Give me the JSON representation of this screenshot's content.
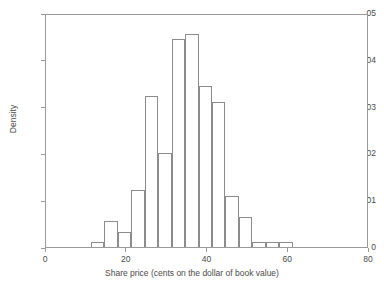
{
  "chart_data": {
    "type": "bar",
    "title": "",
    "subtitle": "",
    "xlabel": "Share price (cents on the dollar of book value)",
    "ylabel": "Density",
    "xlim": [
      0,
      80
    ],
    "ylim": [
      0,
      0.05
    ],
    "xticks": [
      0,
      20,
      40,
      60,
      80
    ],
    "xtick_labels": [
      "0",
      "20",
      "40",
      "60",
      "80"
    ],
    "yticks": [
      0,
      0.01,
      0.02,
      0.03,
      0.04,
      0.05
    ],
    "ytick_labels": [
      "0",
      ".01",
      ".02",
      ".03",
      ".04",
      ".05"
    ],
    "grid": false,
    "legend": null,
    "bin_width": 3.33,
    "bin_starts": [
      11.1,
      14.4,
      17.8,
      21.1,
      24.4,
      27.8,
      31.1,
      34.4,
      37.8,
      41.1,
      44.4,
      47.8,
      51.1,
      54.4,
      57.8,
      61.1,
      64.4,
      67.8
    ],
    "categories": [
      "11.1-14.4",
      "14.4-17.8",
      "17.8-21.1",
      "21.1-24.4",
      "24.4-27.8",
      "27.8-31.1",
      "31.1-34.4",
      "34.4-37.8",
      "37.8-41.1",
      "41.1-44.4",
      "44.4-47.8",
      "47.8-51.1",
      "51.1-54.4",
      "54.4-57.8",
      "57.8-61.1",
      "61.1-64.4",
      "64.4-67.8",
      "67.8-71.1"
    ],
    "values": [
      0.0011,
      0.0055,
      0.0033,
      0.0122,
      0.0322,
      0.02,
      0.0445,
      0.0456,
      0.0344,
      0.031,
      0.0108,
      0.0064,
      0.0011,
      0.0011,
      0.0011,
      0,
      0,
      0
    ],
    "bars": [
      {
        "x0": 11.1,
        "x1": 14.4,
        "density": 0.0011
      },
      {
        "x0": 14.4,
        "x1": 17.8,
        "density": 0.0055
      },
      {
        "x0": 17.8,
        "x1": 21.1,
        "density": 0.0033
      },
      {
        "x0": 21.1,
        "x1": 24.4,
        "density": 0.0122
      },
      {
        "x0": 24.4,
        "x1": 27.8,
        "density": 0.0322
      },
      {
        "x0": 27.8,
        "x1": 31.1,
        "density": 0.02
      },
      {
        "x0": 31.1,
        "x1": 34.4,
        "density": 0.0445
      },
      {
        "x0": 34.4,
        "x1": 37.8,
        "density": 0.0456
      },
      {
        "x0": 37.8,
        "x1": 41.1,
        "density": 0.0344
      },
      {
        "x0": 41.1,
        "x1": 44.4,
        "density": 0.031
      },
      {
        "x0": 44.4,
        "x1": 47.8,
        "density": 0.0108
      },
      {
        "x0": 47.8,
        "x1": 51.1,
        "density": 0.0064
      },
      {
        "x0": 51.1,
        "x1": 54.4,
        "density": 0.0011
      },
      {
        "x0": 54.4,
        "x1": 57.8,
        "density": 0.0011
      },
      {
        "x0": 57.8,
        "x1": 61.1,
        "density": 0.0011
      }
    ],
    "colors": {
      "bar_stroke": "#8c8c8c",
      "bar_fill": "transparent",
      "frame": "#9a9a9a",
      "text": "#4a4a4a",
      "background": "#ffffff"
    }
  }
}
